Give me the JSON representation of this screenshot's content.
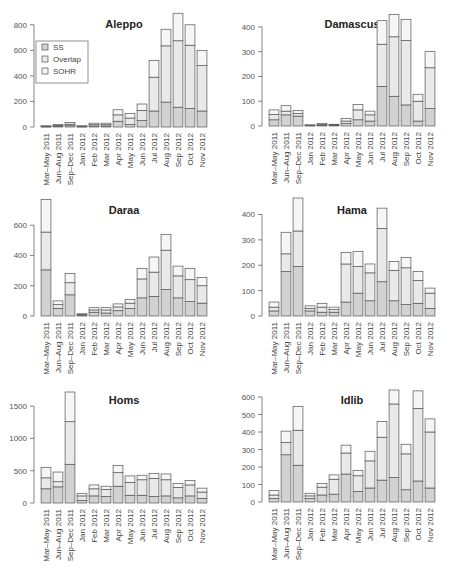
{
  "chart_data": [
    {
      "type": "bar",
      "stacked": true,
      "title": "Aleppo",
      "categories": [
        "Mar–May 2011",
        "Jun–Aug 2011",
        "Sep–Dec 2011",
        "Jan 2012",
        "Feb 2012",
        "Mar 2012",
        "Apr 2012",
        "May 2012",
        "Jun 2012",
        "Jul 2012",
        "Aug 2012",
        "Sep 2012",
        "Oct 2012",
        "Nov 2012"
      ],
      "series": [
        {
          "name": "SS",
          "values": [
            3,
            5,
            10,
            3,
            8,
            8,
            45,
            20,
            50,
            125,
            195,
            155,
            145,
            125
          ]
        },
        {
          "name": "Overlap",
          "values": [
            3,
            8,
            12,
            3,
            10,
            10,
            50,
            50,
            80,
            265,
            440,
            520,
            495,
            355
          ]
        },
        {
          "name": "SOHR",
          "values": [
            4,
            7,
            13,
            4,
            12,
            12,
            40,
            35,
            50,
            130,
            130,
            215,
            160,
            120
          ]
        }
      ],
      "ylim": [
        0,
        900
      ],
      "yticks": [
        0,
        200,
        400,
        600,
        800
      ],
      "legend": [
        "SS",
        "Overlap",
        "SOHR"
      ],
      "legend_position": "top-left",
      "grid": false
    },
    {
      "type": "bar",
      "stacked": true,
      "title": "Damascus",
      "categories": [
        "Mar–May 2011",
        "Jun–Aug 2011",
        "Sep–Dec 2011",
        "Jan 2012",
        "Feb 2012",
        "Mar 2012",
        "Apr 2012",
        "May 2012",
        "Jun 2012",
        "Jul 2012",
        "Aug 2012",
        "Sep 2012",
        "Oct 2012",
        "Nov 2012"
      ],
      "series": [
        {
          "name": "SS",
          "values": [
            25,
            45,
            40,
            2,
            3,
            2,
            10,
            25,
            20,
            160,
            120,
            85,
            20,
            70
          ]
        },
        {
          "name": "Overlap",
          "values": [
            22,
            15,
            10,
            1,
            3,
            2,
            10,
            40,
            25,
            170,
            240,
            260,
            80,
            165
          ]
        },
        {
          "name": "SOHR",
          "values": [
            18,
            22,
            13,
            2,
            4,
            3,
            10,
            22,
            15,
            95,
            90,
            85,
            28,
            65
          ]
        }
      ],
      "ylim": [
        0,
        460
      ],
      "yticks": [
        0,
        100,
        200,
        300,
        400
      ],
      "grid": false
    },
    {
      "type": "bar",
      "stacked": true,
      "title": "Daraa",
      "categories": [
        "Mar–May 2011",
        "Jun–Aug 2011",
        "Sep–Dec 2011",
        "Jan 2012",
        "Feb 2012",
        "Mar 2012",
        "Apr 2012",
        "May 2012",
        "Jun 2012",
        "Jul 2012",
        "Aug 2012",
        "Sep 2012",
        "Oct 2012",
        "Nov 2012"
      ],
      "series": [
        {
          "name": "SS",
          "values": [
            305,
            50,
            140,
            5,
            25,
            20,
            35,
            50,
            120,
            130,
            175,
            120,
            95,
            85
          ]
        },
        {
          "name": "Overlap",
          "values": [
            250,
            25,
            80,
            5,
            15,
            20,
            25,
            35,
            125,
            160,
            260,
            145,
            145,
            115
          ]
        },
        {
          "name": "SOHR",
          "values": [
            215,
            25,
            60,
            5,
            15,
            15,
            20,
            25,
            70,
            100,
            105,
            65,
            75,
            55
          ]
        }
      ],
      "ylim": [
        0,
        780
      ],
      "yticks": [
        0,
        200,
        400,
        600
      ],
      "grid": false
    },
    {
      "type": "bar",
      "stacked": true,
      "title": "Hama",
      "categories": [
        "Mar–May 2011",
        "Jun–Aug 2011",
        "Sep–Dec 2011",
        "Jan 2012",
        "Feb 2012",
        "Mar 2012",
        "Apr 2012",
        "May 2012",
        "Jun 2012",
        "Jul 2012",
        "Aug 2012",
        "Sep 2012",
        "Oct 2012",
        "Nov 2012"
      ],
      "series": [
        {
          "name": "SS",
          "values": [
            20,
            175,
            195,
            20,
            15,
            15,
            55,
            90,
            60,
            135,
            60,
            45,
            50,
            30
          ]
        },
        {
          "name": "Overlap",
          "values": [
            15,
            70,
            140,
            10,
            20,
            10,
            150,
            105,
            110,
            210,
            120,
            145,
            90,
            60
          ]
        },
        {
          "name": "SOHR",
          "values": [
            20,
            85,
            130,
            10,
            15,
            10,
            45,
            60,
            35,
            80,
            35,
            40,
            35,
            20
          ]
        }
      ],
      "ylim": [
        0,
        465
      ],
      "yticks": [
        0,
        100,
        200,
        300,
        400
      ],
      "grid": false
    },
    {
      "type": "bar",
      "stacked": true,
      "title": "Homs",
      "categories": [
        "Mar–May 2011",
        "Jun–Aug 2011",
        "Sep–Dec 2011",
        "Jan 2012",
        "Feb 2012",
        "Mar 2012",
        "Apr 2012",
        "May 2012",
        "Jun 2012",
        "Jul 2012",
        "Aug 2012",
        "Sep 2012",
        "Oct 2012",
        "Nov 2012"
      ],
      "series": [
        {
          "name": "SS",
          "values": [
            220,
            250,
            600,
            40,
            110,
            100,
            260,
            120,
            120,
            100,
            110,
            80,
            110,
            70
          ]
        },
        {
          "name": "Overlap",
          "values": [
            170,
            80,
            660,
            70,
            110,
            110,
            210,
            200,
            240,
            280,
            250,
            160,
            170,
            100
          ]
        },
        {
          "name": "SOHR",
          "values": [
            160,
            150,
            460,
            40,
            60,
            50,
            110,
            100,
            70,
            80,
            90,
            60,
            70,
            60
          ]
        }
      ],
      "ylim": [
        0,
        1720
      ],
      "yticks": [
        0,
        500,
        1000,
        1500
      ],
      "grid": false
    },
    {
      "type": "bar",
      "stacked": true,
      "title": "Idlib",
      "categories": [
        "Mar–May 2011",
        "Jun–Aug 2011",
        "Sep–Dec 2011",
        "Jan 2012",
        "Feb 2012",
        "Mar 2012",
        "Apr 2012",
        "May 2012",
        "Jun 2012",
        "Jul 2012",
        "Aug 2012",
        "Sep 2012",
        "Oct 2012",
        "Nov 2012"
      ],
      "series": [
        {
          "name": "SS",
          "values": [
            20,
            270,
            210,
            20,
            40,
            45,
            160,
            60,
            80,
            125,
            140,
            70,
            120,
            80
          ]
        },
        {
          "name": "Overlap",
          "values": [
            20,
            70,
            200,
            15,
            45,
            85,
            120,
            90,
            155,
            245,
            420,
            205,
            415,
            320
          ]
        },
        {
          "name": "SOHR",
          "values": [
            25,
            65,
            135,
            15,
            20,
            25,
            45,
            30,
            55,
            90,
            80,
            55,
            100,
            75
          ]
        }
      ],
      "ylim": [
        0,
        640
      ],
      "yticks": [
        0,
        100,
        200,
        300,
        400,
        500,
        600
      ],
      "grid": false
    }
  ],
  "colors": {
    "SS": "#d2d2d2",
    "Overlap": "#e9e9e9",
    "SOHR": "#f6f6f6",
    "bar_border": "#555555",
    "axis": "#666666"
  },
  "panels": [
    {
      "title": "Aleppo"
    },
    {
      "title": "Damascus"
    },
    {
      "title": "Daraa"
    },
    {
      "title": "Hama"
    },
    {
      "title": "Homs"
    },
    {
      "title": "Idlib"
    }
  ],
  "legend": {
    "items": [
      "SS",
      "Overlap",
      "SOHR"
    ]
  }
}
